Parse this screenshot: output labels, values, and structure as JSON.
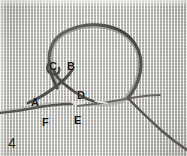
{
  "figure": {
    "number_label": "4",
    "kind": "macro-photograph",
    "background_color": "#d6d5d0",
    "thread_color": "#4a4845",
    "label_color": "#151515"
  },
  "labels": [
    {
      "id": "A",
      "text": "A",
      "x": 31,
      "y": 97,
      "note": "left side, thread emerging from fabric"
    },
    {
      "id": "B",
      "text": "B",
      "x": 67,
      "y": 61,
      "note": "right arm of crossed loop"
    },
    {
      "id": "C",
      "text": "C",
      "x": 49,
      "y": 61,
      "note": "left arm of crossed loop"
    },
    {
      "id": "D",
      "text": "D",
      "x": 77,
      "y": 90,
      "note": "below crossing, right descending thread"
    },
    {
      "id": "E",
      "text": "E",
      "x": 74,
      "y": 115,
      "note": "lower centre, along base thread"
    },
    {
      "id": "F",
      "text": "F",
      "x": 42,
      "y": 117,
      "note": "lower left, below base thread"
    }
  ],
  "annotation_sequence": [
    "A",
    "B",
    "C",
    "D",
    "E",
    "F"
  ],
  "threads": [
    {
      "name": "main-loop",
      "description": "large arc rising from the crossing point up over the top and sweeping down to the right"
    },
    {
      "name": "crossing-left-arm",
      "description": "thread descending from C down-right through the crossing"
    },
    {
      "name": "crossing-right-arm",
      "description": "thread descending from B down-left through the crossing toward A"
    },
    {
      "name": "base-thread-left",
      "description": "thread running from the crossing left toward the frame edge past A and F"
    },
    {
      "name": "base-thread-right",
      "description": "near-horizontal thread running right from the crossing to the junction"
    },
    {
      "name": "loop-tail-right",
      "description": "thread continuing from the junction down-right off the frame"
    }
  ]
}
